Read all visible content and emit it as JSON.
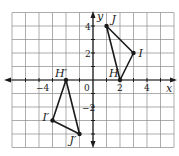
{
  "diagram": {
    "type": "coordinate-plane-reflection",
    "axes": {
      "x_label": "x",
      "y_label": "y",
      "x_range": [
        -6,
        6
      ],
      "y_range": [
        -5,
        5
      ],
      "x_tick_labels": [
        {
          "value": -4,
          "text": "−4"
        },
        {
          "value": 0,
          "text": "0"
        },
        {
          "value": 2,
          "text": "2"
        },
        {
          "value": 4,
          "text": "4"
        }
      ],
      "y_tick_labels": [
        {
          "value": 4,
          "text": "4"
        },
        {
          "value": 2,
          "text": "2"
        },
        {
          "value": -2,
          "text": "−2"
        }
      ]
    },
    "triangles": [
      {
        "name": "HIJ",
        "points": [
          {
            "label": "H",
            "x": 2,
            "y": 0
          },
          {
            "label": "I",
            "x": 3,
            "y": 2
          },
          {
            "label": "J",
            "x": 1,
            "y": 4
          }
        ]
      },
      {
        "name": "H'I'J'",
        "points": [
          {
            "label": "H′",
            "x": -2,
            "y": 0
          },
          {
            "label": "I′",
            "x": -3,
            "y": -3
          },
          {
            "label": "J′",
            "x": -1,
            "y": -4
          }
        ]
      }
    ],
    "colors": {
      "grid": "#8a8a8a",
      "axes": "#1a1a1a",
      "lines": "#1a1a1a"
    }
  }
}
